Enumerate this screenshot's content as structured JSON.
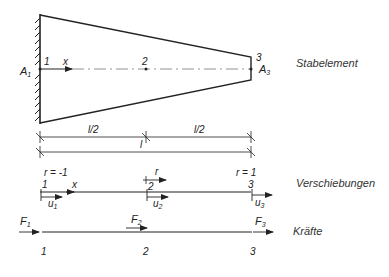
{
  "captions": {
    "element": "Stabelement",
    "displacements": "Verschiebungen",
    "forces": "Kräfte"
  },
  "element": {
    "node1": "1",
    "node2": "2",
    "node3": "3",
    "x_axis": "x",
    "area1": {
      "base": "A",
      "sub": "1"
    },
    "area3": {
      "base": "A",
      "sub": "3"
    }
  },
  "dimensions": {
    "half_left": "l/2",
    "half_right": "l/2",
    "total": "l"
  },
  "displacements": {
    "r_left": "r = -1",
    "r_mid": "r",
    "r_right": "r = 1",
    "node1": "1",
    "node2": "2",
    "node3": "3",
    "x_axis": "x",
    "u1": {
      "base": "u",
      "sub": "1"
    },
    "u2": {
      "base": "u",
      "sub": "2"
    },
    "u3": {
      "base": "u",
      "sub": "3"
    }
  },
  "forces": {
    "F1": {
      "base": "F",
      "sub": "1"
    },
    "F2": {
      "base": "F",
      "sub": "2"
    },
    "F3": {
      "base": "F",
      "sub": "3"
    },
    "node1": "1",
    "node2": "2",
    "node3": "3"
  },
  "colors": {
    "line": "#222222",
    "background": "#ffffff"
  }
}
